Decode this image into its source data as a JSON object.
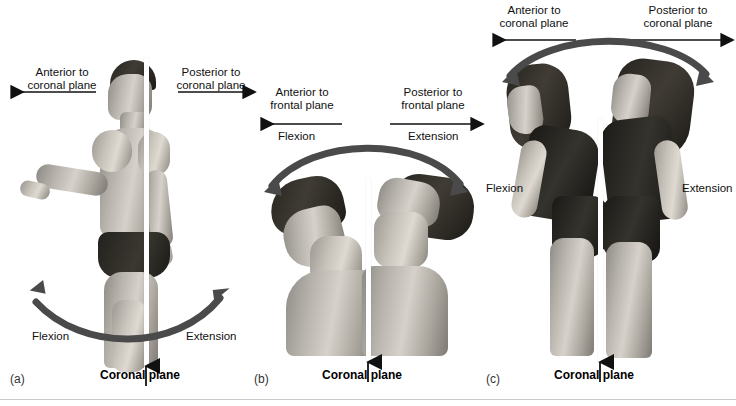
{
  "figure": {
    "background_color": "#ffffff",
    "arrow_color": "#4a4a4a",
    "thin_arrow_color": "#111111",
    "rule_color": "#c9c9c9"
  },
  "panels": [
    {
      "letter": "(a)",
      "subject": "standing-male-lateral-view",
      "top_left_label": "Anterior to\ncoronal plane",
      "top_left_line1": "Anterior to",
      "top_left_line2": "coronal plane",
      "top_right_line1": "Posterior to",
      "top_right_line2": "coronal plane",
      "motion_left": "Flexion",
      "motion_right": "Extension",
      "plane_label": "Coronal plane",
      "top_left_arrow_direction": "left",
      "top_right_arrow_direction": "right",
      "curve_type": "upward-open-double-headed-arc"
    },
    {
      "letter": "(b)",
      "subject": "head-neck-flexion-extension",
      "top_left_line1": "Anterior to",
      "top_left_line2": "frontal plane",
      "top_right_line1": "Posterior to",
      "top_right_line2": "frontal plane",
      "motion_left": "Flexion",
      "motion_right": "Extension",
      "plane_label": "Coronal plane",
      "top_left_arrow_direction": "left",
      "top_right_arrow_direction": "right",
      "curve_type": "downward-open-double-headed-arc"
    },
    {
      "letter": "(c)",
      "subject": "trunk-flexion-extension-female",
      "top_left_line1": "Anterior to",
      "top_left_line2": "coronal plane",
      "top_right_line1": "Posterior to",
      "top_right_line2": "coronal plane",
      "motion_left": "Flexion",
      "motion_right": "Extension",
      "plane_label": "Coronal plane",
      "top_left_arrow_direction": "left",
      "top_right_arrow_direction": "right",
      "curve_type": "downward-open-double-headed-arc"
    }
  ]
}
